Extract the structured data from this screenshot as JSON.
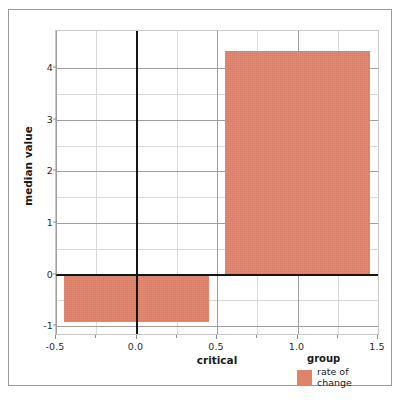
{
  "chart_data": {
    "type": "bar",
    "title": "",
    "xlabel": "critical",
    "ylabel": "median value",
    "xlim": [
      -0.5,
      1.5
    ],
    "ylim": [
      -1.15,
      4.72
    ],
    "grid": true,
    "xticks": [
      -0.5,
      0.0,
      0.5,
      1.0,
      1.5
    ],
    "xtick_labels": [
      "-0.5",
      "0.0",
      "0.5",
      "1.0",
      "1.5"
    ],
    "yticks": [
      -1,
      0,
      1,
      2,
      3,
      4
    ],
    "ytick_labels": [
      "-1",
      "0",
      "1",
      "2",
      "3",
      "4"
    ],
    "minor_yticks": [
      -0.5,
      0.5,
      1.5,
      2.5,
      3.5
    ],
    "minor_xticks": [
      -0.25,
      0.25,
      0.75,
      1.25
    ],
    "series": [
      {
        "name": "rate of change",
        "color": "#e0836b",
        "bars": [
          {
            "x_start": -0.45,
            "x_end": 0.45,
            "value": -0.92
          },
          {
            "x_start": 0.55,
            "x_end": 1.45,
            "value": 4.33
          }
        ]
      }
    ],
    "legend": {
      "title": "group",
      "position": "bottom-right",
      "entries": [
        {
          "label": "rate of\nchange",
          "color": "#e0836b"
        }
      ]
    },
    "reference_lines": [
      {
        "axis": "y",
        "value": 0,
        "color": "#151515"
      },
      {
        "axis": "x",
        "value": 0.0,
        "color": "#151515"
      }
    ]
  }
}
